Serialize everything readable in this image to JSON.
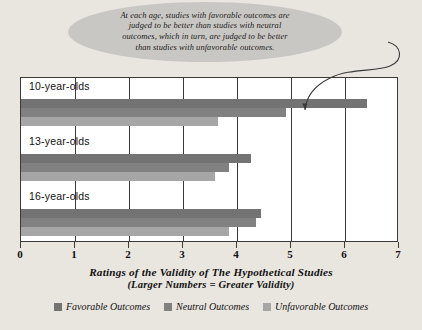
{
  "callout": {
    "text": "At each age, studies with favorable outcomes are\njudged to be better than studies with neutral\noutcomes, which in turn, are judged to be better\nthan studies with unfavorable outcomes.",
    "bubble_color": "#c9c7c3",
    "arrow_name": "callout-arrow"
  },
  "axis_title": {
    "line1": "Ratings of the Validity of The Hypothetical Studies",
    "line2": "(Larger Numbers = Greater Validity)"
  },
  "legend": {
    "items": [
      {
        "label": "Favorable Outcomes",
        "color": "#737373"
      },
      {
        "label": "Neutral Outcomes",
        "color": "#818181"
      },
      {
        "label": "Unfavorable Outcomes",
        "color": "#a6a6a6"
      }
    ]
  },
  "chart_data": {
    "type": "bar",
    "orientation": "horizontal",
    "title": "",
    "xlabel": "Ratings of the Validity of The Hypothetical Studies (Larger Numbers = Greater Validity)",
    "ylabel": "",
    "xlim": [
      0,
      7
    ],
    "xticks": [
      0,
      1,
      2,
      3,
      4,
      5,
      6,
      7
    ],
    "xtick_labels": [
      "0",
      "1",
      "2",
      "3",
      "4",
      "5",
      "6",
      "7"
    ],
    "grid": true,
    "legend_position": "bottom",
    "categories": [
      "10-year-olds",
      "13-year-olds",
      "16-year-olds"
    ],
    "series": [
      {
        "name": "Favorable Outcomes",
        "color": "#737373",
        "values": [
          6.4,
          4.25,
          4.45
        ]
      },
      {
        "name": "Neutral Outcomes",
        "color": "#818181",
        "values": [
          4.9,
          3.85,
          4.35
        ]
      },
      {
        "name": "Unfavorable Outcomes",
        "color": "#a6a6a6",
        "values": [
          3.65,
          3.6,
          3.85
        ]
      }
    ],
    "annotations": [
      {
        "text": "At each age, studies with favorable outcomes are judged to be better than studies with neutral outcomes, which in turn, are judged to be better than studies with unfavorable outcomes.",
        "points_to": {
          "category": "10-year-olds",
          "series": "Favorable Outcomes"
        }
      }
    ]
  }
}
